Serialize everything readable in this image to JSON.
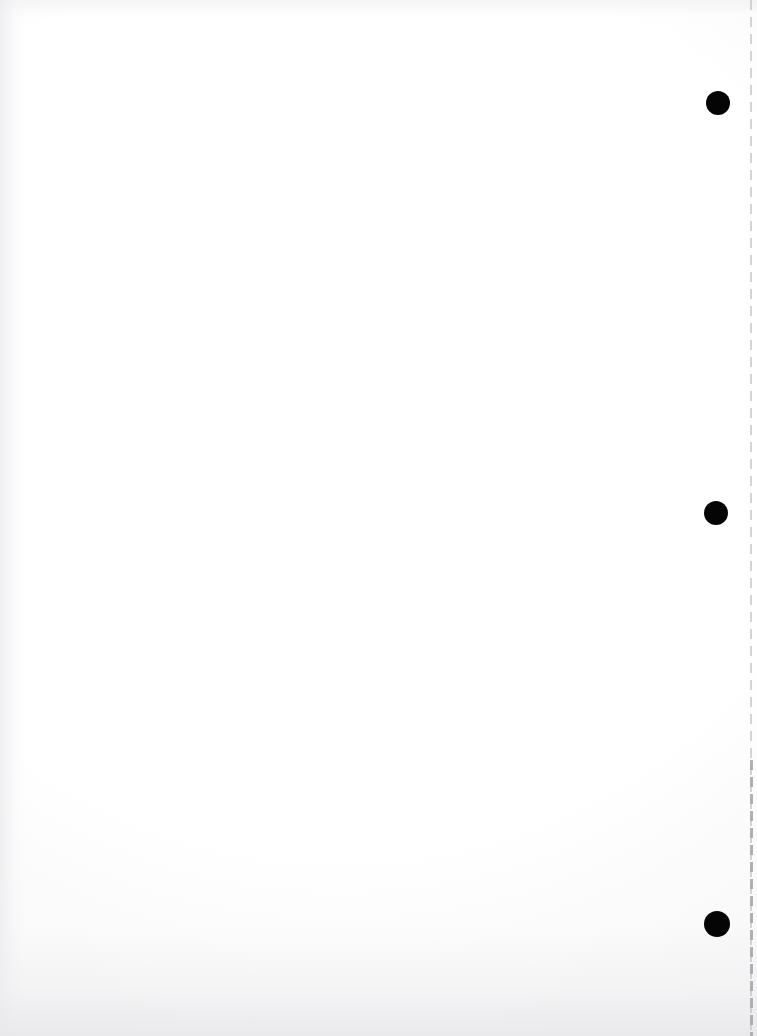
{
  "document": {
    "type": "scanned-page",
    "title": "Scanned blank page",
    "page_width": 757,
    "page_height": 1036,
    "content_text": "",
    "is_blank": true,
    "background_color": "#fdfdfd",
    "ink_color": "#050505"
  },
  "marks": {
    "registration_dots": {
      "label": "registration dots",
      "count": 3,
      "color": "#050505",
      "items": [
        {
          "name": "registration-dot-top",
          "cx": 718,
          "cy": 103,
          "diameter": 24
        },
        {
          "name": "registration-dot-middle",
          "cx": 716,
          "cy": 513,
          "diameter": 24
        },
        {
          "name": "registration-dot-bottom",
          "cx": 717,
          "cy": 924,
          "diameter": 26
        }
      ]
    },
    "perforation_line": {
      "label": "perforation line",
      "orientation": "vertical",
      "x": 750,
      "y_start": 0,
      "y_end": 1036,
      "style": "dashed",
      "dash_length": 10,
      "gap_length": 7,
      "color": "#c4c4c8"
    }
  },
  "scan_artifacts": {
    "vignette": true,
    "paper_mottling": true,
    "bottom_edge_shadow": true,
    "left_edge_shadow": true,
    "top_edge_shadow": true
  }
}
